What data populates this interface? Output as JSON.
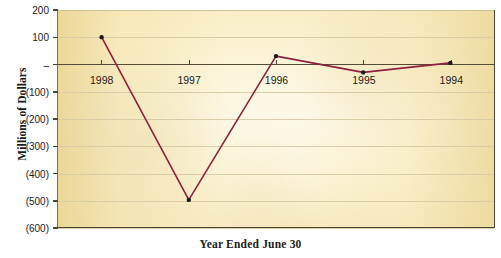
{
  "chart_data": {
    "type": "line",
    "title": "",
    "xlabel": "Year Ended June 30",
    "ylabel": "Millions of Dollars",
    "categories": [
      "1998",
      "1997",
      "1996",
      "1995",
      "1994"
    ],
    "values": [
      100,
      -500,
      30,
      -30,
      5
    ],
    "series": [
      {
        "name": "Net Income (Loss)",
        "values": [
          100,
          -500,
          30,
          -30,
          5
        ],
        "color": "#8e2040",
        "marker": "circle",
        "marker_color": "#1a1a1a"
      }
    ],
    "ylim": [
      -600,
      200
    ],
    "ytick_values": [
      200,
      100,
      0,
      -100,
      -200,
      -300,
      -400,
      -500,
      -600
    ],
    "ytick_labels": [
      "200",
      "100",
      "–",
      "(100)",
      "(200)",
      "(300)",
      "(400)",
      "(500)",
      "(600)"
    ],
    "grid": true,
    "grid_axis": "y",
    "legend": "none",
    "zero_line": true,
    "xtick_labels_below_zero": true,
    "plot_background_color": "#fbf3d4",
    "grid_color": "#d8cda6",
    "axis_color": "#4e4634"
  },
  "figure": {
    "y_axis_title": "Millions of Dollars",
    "x_axis_title": "Year Ended June 30"
  }
}
